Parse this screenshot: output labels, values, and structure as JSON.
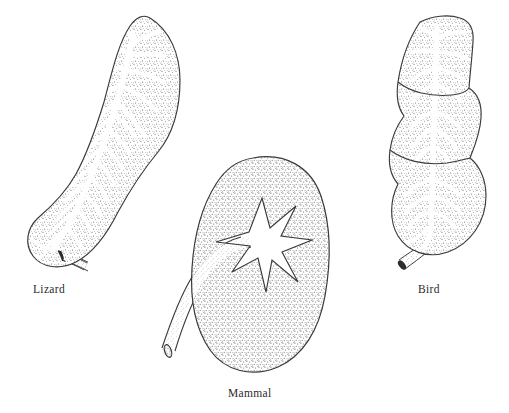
{
  "figure": {
    "background_color": "#ffffff",
    "ink_color": "#2b2b2b",
    "stipple_color": "#555555",
    "width": 509,
    "height": 413
  },
  "specimens": [
    {
      "id": "lizard",
      "label": "Lizard",
      "organ": "kidney",
      "shape": "elongate-curved",
      "duct_pattern": "dendritic-herringbone",
      "lobe_count": 1,
      "ureter_position": "lower-left",
      "label_x": 33,
      "label_y": 283
    },
    {
      "id": "mammal",
      "label": "Mammal",
      "organ": "kidney",
      "shape": "bean",
      "duct_pattern": "star-renal-pelvis",
      "lobe_count": 1,
      "ureter_position": "lower-left",
      "label_x": 228,
      "label_y": 387
    },
    {
      "id": "bird",
      "label": "Bird",
      "organ": "kidney",
      "shape": "trilobed-elongate",
      "duct_pattern": "dendritic",
      "lobe_count": 3,
      "ureter_position": "lower-left",
      "label_x": 418,
      "label_y": 283
    }
  ]
}
